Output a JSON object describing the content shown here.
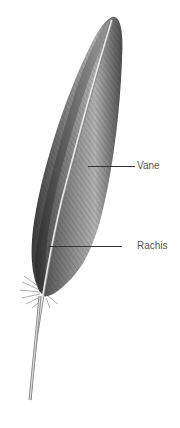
{
  "diagram": {
    "labels": [
      {
        "id": "vane",
        "text": "Vane",
        "x": 137,
        "y": 161,
        "line_x1": 88,
        "line_x2": 135,
        "line_y": 166
      },
      {
        "id": "rachis",
        "text": "Rachis",
        "x": 137,
        "y": 240,
        "line_x1": 49,
        "line_x2": 122,
        "line_y": 246
      }
    ],
    "colors": {
      "background": "#ffffff",
      "ink": "#333333",
      "label": "#555555"
    }
  }
}
